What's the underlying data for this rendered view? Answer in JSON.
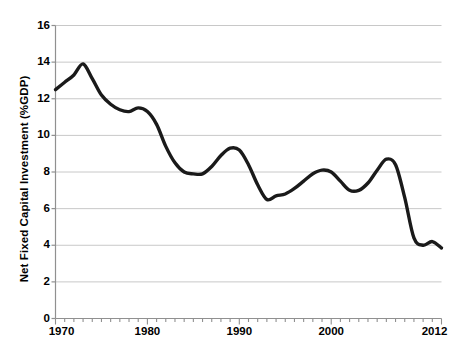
{
  "chart_data": {
    "type": "line",
    "title": "",
    "subtitle": "",
    "xlabel": "",
    "ylabel": "Net Fixed Capital Investment (%GDP)",
    "xlim": [
      1970,
      2012
    ],
    "ylim": [
      0,
      16
    ],
    "grid": "horizontal",
    "legend": "none",
    "x_tick_labels": [
      "1970",
      "1980",
      "1990",
      "2000",
      "2012"
    ],
    "x_tick_values": [
      1970,
      1980,
      1990,
      2000,
      2012
    ],
    "y_tick_labels": [
      "0",
      "2",
      "4",
      "6",
      "8",
      "10",
      "12",
      "14",
      "16"
    ],
    "y_tick_values": [
      0,
      2,
      4,
      6,
      8,
      10,
      12,
      14,
      16
    ],
    "minor_x_tick_interval": 1,
    "line_color": "#1a1a1a",
    "line_width": 3.4,
    "grid_color": "#c8c8c8",
    "axis_color": "#808080",
    "background_color": "#ffffff",
    "series": [
      {
        "name": "Net Fixed Capital Investment (%GDP)",
        "x": [
          1970,
          1971,
          1972,
          1973,
          1974,
          1975,
          1976,
          1977,
          1978,
          1979,
          1980,
          1981,
          1982,
          1983,
          1984,
          1985,
          1986,
          1987,
          1988,
          1989,
          1990,
          1991,
          1992,
          1993,
          1994,
          1995,
          1996,
          1997,
          1998,
          1999,
          2000,
          2001,
          2002,
          2003,
          2004,
          2005,
          2006,
          2007,
          2008,
          2009,
          2010,
          2011,
          2012
        ],
        "values": [
          12.5,
          12.9,
          13.3,
          13.9,
          13.1,
          12.2,
          11.7,
          11.4,
          11.3,
          11.5,
          11.3,
          10.6,
          9.4,
          8.5,
          8.0,
          7.9,
          7.9,
          8.3,
          8.9,
          9.3,
          9.2,
          8.4,
          7.3,
          6.5,
          6.7,
          6.8,
          7.1,
          7.5,
          7.9,
          8.1,
          8.0,
          7.5,
          7.0,
          7.0,
          7.4,
          8.1,
          8.7,
          8.4,
          6.6,
          4.4,
          4.0,
          4.2,
          3.85
        ]
      }
    ]
  },
  "axes": {
    "y_axis_title": "Net Fixed Capital Investment (%GDP)"
  }
}
